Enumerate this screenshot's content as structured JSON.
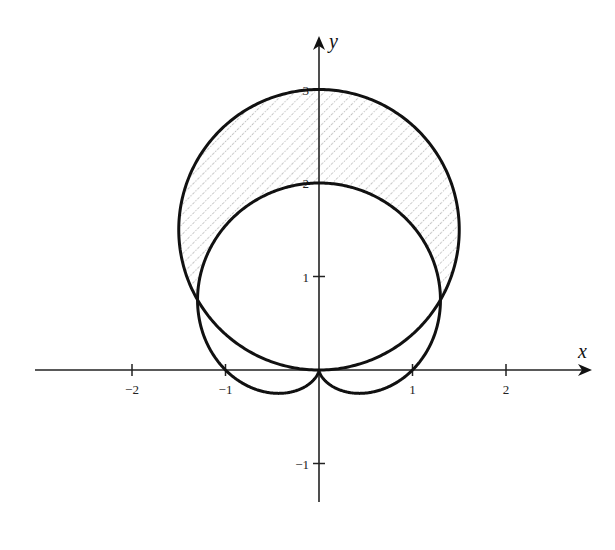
{
  "figure": {
    "origin_px": [
      319,
      370
    ],
    "unit_px": 93.5,
    "colors": {
      "curve": "#111111",
      "axis": "#222222",
      "hatch": "#8a8a8a",
      "background": "#ffffff"
    }
  },
  "axes": {
    "x": {
      "label": "x",
      "range_px": [
        35,
        592
      ],
      "ticks": [
        {
          "value": -2,
          "label": "−2"
        },
        {
          "value": -1,
          "label": "−1"
        },
        {
          "value": 1,
          "label": "1"
        },
        {
          "value": 2,
          "label": "2"
        }
      ]
    },
    "y": {
      "label": "y",
      "range_px": [
        502,
        36
      ],
      "ticks": [
        {
          "value": -1,
          "label": "−1"
        },
        {
          "value": 1,
          "label": "1"
        },
        {
          "value": 2,
          "label": "2"
        },
        {
          "value": 3,
          "label": "3"
        }
      ]
    }
  },
  "curves": [
    {
      "name": "circle",
      "equation": "r = 3 sin θ",
      "center": [
        0,
        1.5
      ],
      "radius": 1.5
    },
    {
      "name": "cardioid",
      "equation": "r = 1 + sin θ"
    }
  ],
  "shaded_region": {
    "description": "inside r = 3 sin θ, outside r = 1 + sin θ",
    "intersection_points": [
      [
        -1.299,
        0.75
      ],
      [
        1.299,
        0.75
      ]
    ],
    "pattern": "diagonal dotted hatch"
  }
}
